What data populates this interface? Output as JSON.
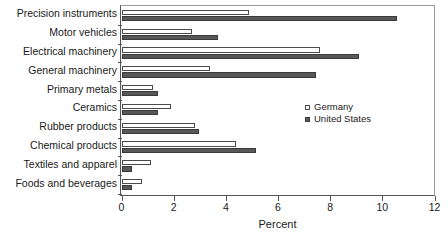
{
  "chart_data": {
    "type": "bar",
    "orientation": "horizontal",
    "title": "",
    "xlabel": "Percent",
    "ylabel": "",
    "xlim": [
      0,
      12
    ],
    "xticks": [
      0,
      2,
      4,
      6,
      8,
      10,
      12
    ],
    "xtick_labels": [
      "0",
      "2",
      "4",
      "6",
      "8",
      "10",
      "12"
    ],
    "grid": false,
    "legend_position": "middle-right-inside",
    "categories": [
      "Precision instruments",
      "Motor vehicles",
      "Electrical machinery",
      "General machinery",
      "Primary metals",
      "Ceramics",
      "Rubber products",
      "Chemical products",
      "Textiles and apparel",
      "Foods and beverages"
    ],
    "series": [
      {
        "name": "Germany",
        "color": "#ffffff",
        "edge_color": "#4b4b4b",
        "values": [
          4.9,
          2.7,
          7.6,
          3.4,
          1.2,
          1.9,
          2.8,
          4.4,
          1.15,
          0.8
        ]
      },
      {
        "name": "United States",
        "color": "#585858",
        "edge_color": "#3a3a3a",
        "values": [
          10.55,
          3.7,
          9.1,
          7.45,
          1.4,
          1.4,
          2.97,
          5.15,
          0.42,
          0.4
        ]
      }
    ]
  },
  "legend": {
    "items": [
      {
        "label": "Germany",
        "swatch": "hollow-square"
      },
      {
        "label": "United States",
        "swatch": "filled-square"
      }
    ]
  },
  "axis": {
    "x_title": "Percent"
  },
  "colors": {
    "germany": "#ffffff",
    "united_states": "#585858",
    "axis": "#555555",
    "text": "#1a1a1a"
  }
}
